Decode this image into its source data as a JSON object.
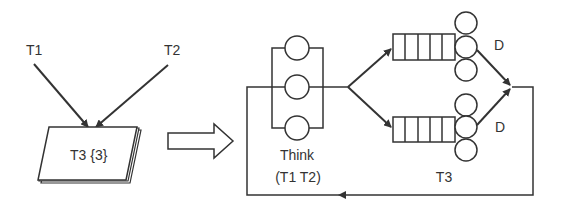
{
  "colors": {
    "stroke": "#333333",
    "background": "#ffffff",
    "text": "#333333"
  },
  "left_model": {
    "inputs": [
      {
        "label": "T1"
      },
      {
        "label": "T2"
      }
    ],
    "document_stack": {
      "label": "T3 {3}"
    }
  },
  "transform_arrow": {
    "icon": "block-arrow-right"
  },
  "right_model": {
    "think_station": {
      "label_line1": "Think",
      "label_line2": "(T1 T2)",
      "servers": 3
    },
    "disk_stations": [
      {
        "label": "D",
        "queue_slots": 5,
        "servers": 3
      },
      {
        "label": "D",
        "queue_slots": 5,
        "servers": 3
      }
    ],
    "class_label": "T3"
  }
}
